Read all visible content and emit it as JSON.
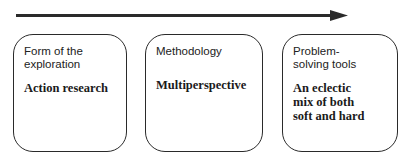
{
  "diagram": {
    "arrow": {
      "direction": "right",
      "color": "#2a2a2a"
    },
    "boxes": [
      {
        "heading": "Form of the\nexploration",
        "value": "Action research"
      },
      {
        "heading": "Methodology",
        "value": "Multiperspective"
      },
      {
        "heading": "Problem-\nsolving tools",
        "value": "An eclectic\nmix of both\nsoft and hard"
      }
    ]
  }
}
